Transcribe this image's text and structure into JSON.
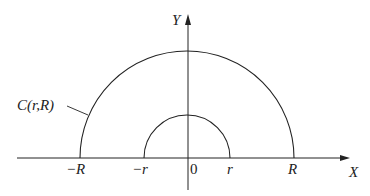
{
  "diagram": {
    "axes": {
      "x_label": "X",
      "y_label": "Y",
      "origin_label": "0"
    },
    "ticks": {
      "neg_R": "−R",
      "neg_r": "−r",
      "r": "r",
      "R": "R"
    },
    "outer_arc": {
      "label": "C(r,R)",
      "description": "semicircle of radius R"
    },
    "inner_arc": {
      "description": "semicircle of radius r"
    },
    "colors": {
      "stroke": "#222222",
      "background": "#ffffff"
    }
  }
}
